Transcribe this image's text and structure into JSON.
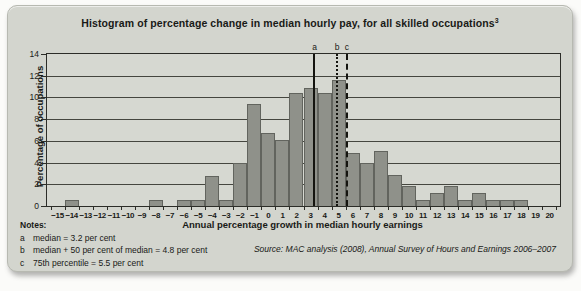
{
  "title": {
    "text": "Histogram of percentage change in median hourly pay, for all skilled occupations",
    "superscript": "3"
  },
  "chart_data": {
    "type": "bar",
    "title": "Histogram of percentage change in median hourly pay, for all skilled occupations",
    "xlabel": "Annual percentage growth in median hourly earnings",
    "ylabel": "Percentage of occupations",
    "categories": [
      -15,
      -14,
      -13,
      -12,
      -11,
      -10,
      -9,
      -8,
      -7,
      -6,
      -5,
      -4,
      -3,
      -2,
      -1,
      0,
      1,
      2,
      3,
      4,
      5,
      6,
      7,
      8,
      9,
      10,
      11,
      12,
      13,
      14,
      15,
      16,
      17,
      18,
      19,
      20
    ],
    "values": [
      0,
      0.6,
      0,
      0,
      0,
      0,
      0,
      0.6,
      0,
      0.6,
      0.6,
      2.8,
      0.6,
      4.0,
      9.4,
      6.7,
      6.1,
      10.4,
      10.9,
      10.4,
      11.6,
      4.9,
      4.0,
      5.1,
      2.9,
      1.8,
      0.6,
      1.2,
      1.8,
      0.6,
      1.2,
      0.6,
      0.6,
      0.6,
      0,
      0
    ],
    "ylim": [
      0,
      14
    ],
    "y_tick_step": 2,
    "grid": "horizontal",
    "bar_gap": 0,
    "reference_lines": [
      {
        "label": "a",
        "value": 3.2,
        "style": "solid"
      },
      {
        "label": "b",
        "value": 4.8,
        "style": "dotted"
      },
      {
        "label": "c",
        "value": 5.5,
        "style": "dashed"
      }
    ]
  },
  "y_axis": {
    "title": "Percentage of occupations"
  },
  "x_axis": {
    "title": "Annual percentage growth in median hourly earnings"
  },
  "notes": {
    "heading": "Notes:",
    "items": [
      {
        "key": "a",
        "text": "median = 3.2 per cent"
      },
      {
        "key": "b",
        "text": "median + 50 per cent of median = 4.8 per cent"
      },
      {
        "key": "c",
        "text": "75th percentile = 5.5 per cent"
      }
    ]
  },
  "source": "Source: MAC analysis (2008), Annual Survey of Hours and Earnings 2006–2007",
  "colors": {
    "panel_background": "#d3d5ce",
    "plot_background": "#d6d8d1",
    "bar_fill": "#8f918a",
    "bar_border": "#62645e",
    "gridline": "#45463f",
    "text": "#191a17",
    "reference_line": "#14140f"
  }
}
